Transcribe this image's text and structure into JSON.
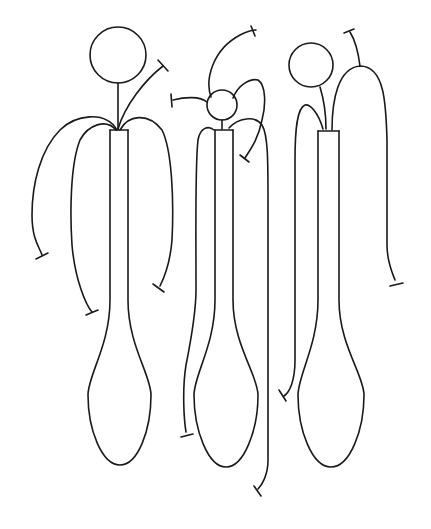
{
  "diagram": {
    "width": 431,
    "height": 529,
    "stroke_color": "#1a1a1a",
    "background": "#ffffff",
    "figures": [
      {
        "id": "figure-1",
        "head": {
          "cx": 118,
          "cy": 55,
          "r": 28
        },
        "neck": "M118 83 L118 129",
        "stem_top": "M110 130 L128 130",
        "body": "M110 130 L110 300 C110 345 88 375 88 395 C88 430 102 465 120 465 C138 465 151 430 151 395 C151 375 128 345 128 300 L128 130",
        "arms": [
          {
            "path": "M118 129 C125 105 145 80 163 66",
            "cap": "M158 60 L168 71"
          },
          {
            "path": "M117 130 C105 110 75 115 60 130 C40 150 32 185 32 215 C32 240 40 248 42 255",
            "cap": "M36 259 L48 253"
          },
          {
            "path": "M116 130 C106 118 88 125 80 140 C70 165 70 215 72 245 C75 280 86 305 92 312",
            "cap": "M86 315 L98 310"
          },
          {
            "path": "M120 130 C128 115 148 112 162 130 C172 150 174 200 172 240 C170 265 163 280 160 286",
            "cap": "M153 284 L164 292"
          }
        ]
      },
      {
        "id": "figure-2",
        "head": {
          "cx": 222,
          "cy": 105,
          "r": 15
        },
        "neck": "M222 120 L222 129",
        "stem_top": "M215 130 L233 130",
        "body": "M215 130 L215 300 C215 345 194 375 194 395 C194 430 208 467 226 467 C244 467 258 430 258 395 C258 375 233 345 233 300 L233 130",
        "arms": [
          {
            "path": "M211 97 C205 80 212 50 240 35 C250 30 255 30 256 30",
            "cap": "M251 26 L255 36"
          },
          {
            "path": "M207 102 C200 96 185 97 173 100",
            "cap": "M171 94 L172 107"
          },
          {
            "path": "M233 98 C238 85 250 78 258 80 C266 85 266 105 262 120 C258 140 250 150 245 158",
            "cap": "M240 155 L249 162"
          },
          {
            "path": "M214 130 C208 125 200 128 198 140 C195 165 196 225 196 290 C196 315 190 345 186 365 C182 390 184 420 186 432",
            "cap": "M181 437 L193 434"
          },
          {
            "path": "M229 128 C238 118 255 115 262 125 C268 135 268 160 268 200 L268 460 C268 475 262 485 258 489",
            "cap": "M254 486 L261 496"
          }
        ]
      },
      {
        "id": "figure-3",
        "head": {
          "cx": 311,
          "cy": 65,
          "r": 22
        },
        "neck": "M320 87 C324 100 326 115 326 129",
        "stem_top": "M318 131 L339 131",
        "body": "M318 131 L318 300 C318 345 298 375 298 395 C298 430 312 467 331 467 C350 467 364 430 364 395 C364 375 339 345 339 300 L339 131",
        "arms": [
          {
            "path": "M323 129 C318 112 310 104 305 105 C297 108 295 130 295 160 L295 360 C295 380 290 392 284 396",
            "cap": "M279 390 L286 401"
          },
          {
            "path": "M332 130 C332 100 338 68 360 66 C385 66 386 105 387 140 L387 245 C387 262 392 272 395 280",
            "cap": "M390 286 L403 283"
          },
          {
            "path": "M360 66 C358 50 355 40 350 32",
            "cap": "M344 33 L354 29"
          }
        ]
      }
    ]
  }
}
